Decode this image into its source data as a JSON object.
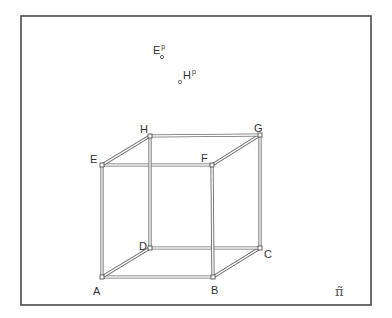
{
  "figure": {
    "plane_label": "π̃",
    "frame": {
      "x1": 21,
      "y1": 16,
      "x2": 371,
      "y2": 305
    },
    "vertices": [
      {
        "id": "A",
        "label": "A",
        "x": 102,
        "y": 277,
        "lx": 93,
        "ly": 295
      },
      {
        "id": "B",
        "label": "B",
        "x": 213,
        "y": 277,
        "lx": 211,
        "ly": 294
      },
      {
        "id": "C",
        "label": "C",
        "x": 260,
        "y": 248,
        "lx": 264,
        "ly": 258
      },
      {
        "id": "D",
        "label": "D",
        "x": 150,
        "y": 248,
        "lx": 139,
        "ly": 250
      },
      {
        "id": "E",
        "label": "E",
        "x": 102,
        "y": 165,
        "lx": 90,
        "ly": 163
      },
      {
        "id": "F",
        "label": "F",
        "x": 212,
        "y": 165,
        "lx": 201,
        "ly": 162
      },
      {
        "id": "G",
        "label": "G",
        "x": 260,
        "y": 135,
        "lx": 254,
        "ly": 132
      },
      {
        "id": "H",
        "label": "H",
        "x": 150,
        "y": 136,
        "lx": 140,
        "ly": 133
      }
    ],
    "edges": [
      [
        "A",
        "B"
      ],
      [
        "B",
        "C"
      ],
      [
        "C",
        "D"
      ],
      [
        "D",
        "A"
      ],
      [
        "E",
        "F"
      ],
      [
        "F",
        "G"
      ],
      [
        "G",
        "H"
      ],
      [
        "H",
        "E"
      ],
      [
        "A",
        "E"
      ],
      [
        "B",
        "F"
      ],
      [
        "C",
        "G"
      ],
      [
        "D",
        "H"
      ]
    ],
    "projected_points": [
      {
        "id": "Ep",
        "label": "E",
        "sup": "p",
        "x": 162,
        "y": 57,
        "lx": 153,
        "ly": 54
      },
      {
        "id": "Hp",
        "label": "H",
        "sup": "p",
        "x": 180,
        "y": 82,
        "lx": 183,
        "ly": 79
      }
    ]
  }
}
